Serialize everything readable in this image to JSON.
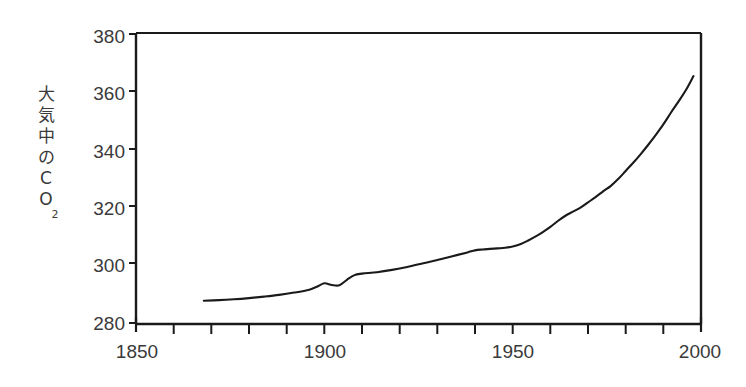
{
  "chart_data": {
    "type": "line",
    "title": "",
    "subtitle": "",
    "xlabel": "",
    "ylabel": "大気中のCO₂",
    "ylabel_main": "大気中のCO",
    "ylabel_subscript": "2",
    "xlim": [
      1850,
      2000
    ],
    "ylim": [
      280,
      380
    ],
    "x_ticks_major": [
      1850,
      1900,
      1950,
      2000
    ],
    "x_tick_labels": [
      "1850",
      "1900",
      "1950",
      "2000"
    ],
    "x_ticks_minor": [
      1860,
      1870,
      1880,
      1890,
      1910,
      1920,
      1930,
      1940,
      1960,
      1970,
      1980,
      1990
    ],
    "y_ticks": [
      280,
      300,
      320,
      340,
      360,
      380
    ],
    "y_tick_labels": [
      "280",
      "300",
      "320",
      "340",
      "360",
      "380"
    ],
    "grid": false,
    "legend": null,
    "legend_position": "none",
    "units": "ppm",
    "line_color": "#1a1a1a",
    "background_color": "#ffffff",
    "axis_color": "#1a1a1a",
    "label_color": "#3a3a3a",
    "series": [
      {
        "name": "大気中のCO₂",
        "x": [
          1868,
          1872,
          1876,
          1880,
          1884,
          1888,
          1892,
          1896,
          1898,
          1900,
          1902,
          1904,
          1906,
          1908,
          1910,
          1914,
          1918,
          1922,
          1926,
          1930,
          1934,
          1938,
          1940,
          1942,
          1944,
          1946,
          1948,
          1950,
          1952,
          1954,
          1956,
          1958,
          1960,
          1962,
          1964,
          1966,
          1968,
          1970,
          1972,
          1974,
          1976,
          1978,
          1980,
          1982,
          1984,
          1986,
          1988,
          1990,
          1992,
          1994,
          1996,
          1998
        ],
        "y": [
          288.0,
          288.2,
          288.5,
          288.9,
          289.4,
          290.0,
          290.8,
          291.8,
          292.8,
          294.0,
          293.4,
          293.3,
          295.2,
          296.8,
          297.3,
          297.8,
          298.6,
          299.6,
          300.8,
          302.0,
          303.3,
          304.6,
          305.3,
          305.6,
          305.8,
          306.0,
          306.2,
          306.6,
          307.4,
          308.6,
          310.0,
          311.6,
          313.4,
          315.4,
          317.2,
          318.6,
          320.0,
          321.8,
          323.6,
          325.6,
          327.4,
          329.8,
          332.6,
          335.4,
          338.4,
          341.6,
          345.0,
          348.6,
          352.6,
          356.4,
          360.4,
          365.2
        ]
      }
    ]
  },
  "axes": {
    "y_title_chars": [
      "大",
      "気",
      "中",
      "の",
      "C",
      "O"
    ],
    "y_title_subscript": "2"
  }
}
